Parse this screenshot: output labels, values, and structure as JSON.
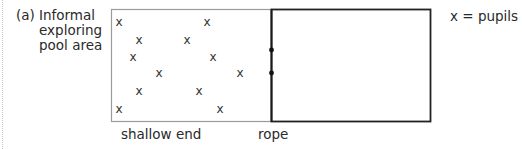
{
  "caption": {
    "letter": "(a)",
    "lines": [
      "Informal",
      "exploring",
      "pool area"
    ]
  },
  "legend": {
    "symbol": "x",
    "equals": "=",
    "meaning": "pupils"
  },
  "labels": {
    "shallow_end": "shallow end",
    "rope": "rope"
  },
  "pool": {
    "shallow_area": {
      "x": 111,
      "y": 9,
      "width": 160,
      "height": 112,
      "border_color": "#9a9a9a"
    },
    "deep_area": {
      "x": 271,
      "y": 9,
      "width": 159,
      "height": 112,
      "border_color": "#222222"
    },
    "rope_anchor_points": [
      {
        "x": 271,
        "y": 50
      },
      {
        "x": 271,
        "y": 73
      }
    ]
  },
  "pupils": {
    "symbol": "x",
    "count": 12,
    "positions": [
      {
        "x": 119,
        "y": 22
      },
      {
        "x": 207,
        "y": 22
      },
      {
        "x": 139,
        "y": 40
      },
      {
        "x": 187,
        "y": 40
      },
      {
        "x": 133,
        "y": 57
      },
      {
        "x": 213,
        "y": 57
      },
      {
        "x": 159,
        "y": 73
      },
      {
        "x": 240,
        "y": 73
      },
      {
        "x": 139,
        "y": 91
      },
      {
        "x": 199,
        "y": 91
      },
      {
        "x": 119,
        "y": 109
      },
      {
        "x": 220,
        "y": 109
      }
    ]
  }
}
